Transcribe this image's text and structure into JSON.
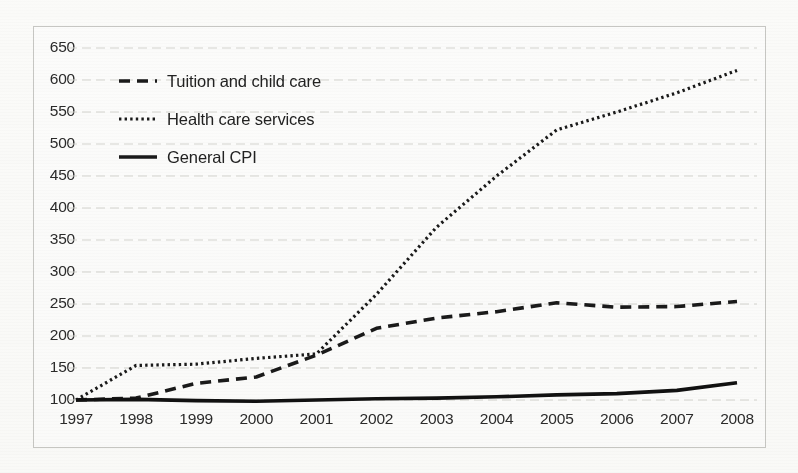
{
  "chart_data": {
    "type": "line",
    "title": "",
    "subtitle": "",
    "xlabel": "",
    "ylabel": "",
    "x": [
      1997,
      1998,
      1999,
      2000,
      2001,
      2002,
      2003,
      2004,
      2005,
      2006,
      2007,
      2008
    ],
    "xtick_labels": [
      "1997",
      "1998",
      "1999",
      "2000",
      "2001",
      "2002",
      "2003",
      "2004",
      "2005",
      "2006",
      "2007",
      "2008"
    ],
    "ytick_labels": [
      "650",
      "600",
      "550",
      "500",
      "450",
      "400",
      "350",
      "300",
      "250",
      "200",
      "150",
      "100"
    ],
    "ytick_values": [
      650,
      600,
      550,
      500,
      450,
      400,
      350,
      300,
      250,
      200,
      150,
      100
    ],
    "ylim": [
      100,
      650
    ],
    "xlim": [
      1997,
      2008
    ],
    "grid": true,
    "grid_axis": "y",
    "legend_position": "upper-left-inside",
    "series": [
      {
        "name": "Tuition and child care",
        "style": "dashed",
        "color": "#1a1a1a",
        "values": [
          100,
          103,
          126,
          136,
          170,
          212,
          228,
          238,
          252,
          245,
          246,
          254
        ]
      },
      {
        "name": "Health care services",
        "style": "dotted",
        "color": "#1a1a1a",
        "values": [
          100,
          154,
          156,
          165,
          172,
          265,
          370,
          450,
          522,
          550,
          580,
          615
        ]
      },
      {
        "name": "General CPI",
        "style": "solid",
        "color": "#111111",
        "values": [
          100,
          101,
          99,
          98,
          100,
          102,
          103,
          105,
          108,
          110,
          115,
          127
        ]
      }
    ]
  },
  "legend": {
    "items": [
      {
        "label": "Tuition and child care",
        "style": "dashed"
      },
      {
        "label": "Health care services",
        "style": "dotted"
      },
      {
        "label": "General CPI",
        "style": "solid"
      }
    ]
  }
}
